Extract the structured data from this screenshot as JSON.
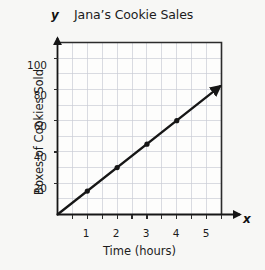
{
  "chart_data": {
    "type": "line",
    "title": "Jana’s Cookie Sales",
    "xlabel": "Time (hours)",
    "ylabel": "Boxes of Cookies Sold",
    "x_axis_symbol": "x",
    "y_axis_symbol": "y",
    "x": [
      0,
      1,
      2,
      3,
      4
    ],
    "values": [
      0,
      15,
      30,
      45,
      60
    ],
    "points": [
      {
        "x": 1,
        "y": 15
      },
      {
        "x": 2,
        "y": 30
      },
      {
        "x": 3,
        "y": 45
      },
      {
        "x": 4,
        "y": 60
      }
    ],
    "line_start": {
      "x": 0,
      "y": 0
    },
    "line_end": {
      "x": 5.45,
      "y": 82
    },
    "slope": 15,
    "xlim": [
      0,
      5.5
    ],
    "ylim": [
      0,
      110
    ],
    "x_tick_labels": [
      "1",
      "2",
      "3",
      "4",
      "5"
    ],
    "x_tick_values": [
      1,
      2,
      3,
      4,
      5
    ],
    "y_tick_labels": [
      "20",
      "40",
      "60",
      "80",
      "100"
    ],
    "y_tick_values": [
      20,
      40,
      60,
      80,
      100
    ],
    "x_minor_step": 0.5,
    "y_minor_step": 10,
    "grid": true,
    "legend": null,
    "line_has_arrow": true,
    "colors": {
      "background": "#f7f7f5",
      "plot_background": "#fdfdfc",
      "grid": "#c9ccd6",
      "axis": "#1a1a1a",
      "series": "#161616",
      "text": "#1c1c1c"
    }
  }
}
